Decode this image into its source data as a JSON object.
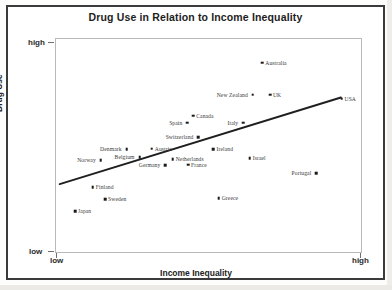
{
  "chart_data": {
    "type": "scatter",
    "title": "Drug Use in Relation to Income Inequality",
    "xlabel": "Income Inequality",
    "ylabel": "Drug Use",
    "xticks": [
      "low",
      "high"
    ],
    "yticks": [
      "low",
      "high"
    ],
    "xlim": [
      "low",
      "high"
    ],
    "ylim": [
      "low",
      "high"
    ],
    "grid": false,
    "legend": null,
    "trendline": {
      "present": true,
      "x0": 0.012,
      "y0": 0.325,
      "x1": 0.928,
      "y1": 0.728
    },
    "points": [
      {
        "label": "Australia",
        "x": 0.672,
        "y": 0.89,
        "label_side": "right"
      },
      {
        "label": "New Zealand",
        "x": 0.641,
        "y": 0.74,
        "label_side": "left"
      },
      {
        "label": "UK",
        "x": 0.697,
        "y": 0.74,
        "label_side": "right"
      },
      {
        "label": "USA",
        "x": 0.93,
        "y": 0.722,
        "label_side": "right"
      },
      {
        "label": "Canada",
        "x": 0.447,
        "y": 0.643,
        "label_side": "right"
      },
      {
        "label": "Spain",
        "x": 0.428,
        "y": 0.61,
        "label_side": "left"
      },
      {
        "label": "Italy",
        "x": 0.61,
        "y": 0.61,
        "label_side": "left"
      },
      {
        "label": "Switzerland",
        "x": 0.464,
        "y": 0.543,
        "label_side": "left"
      },
      {
        "label": "Denmark",
        "x": 0.23,
        "y": 0.488,
        "label_side": "left"
      },
      {
        "label": "Austria",
        "x": 0.312,
        "y": 0.49,
        "label_side": "right"
      },
      {
        "label": "Ireland",
        "x": 0.513,
        "y": 0.488,
        "label_side": "right"
      },
      {
        "label": "Belgium",
        "x": 0.272,
        "y": 0.45,
        "label_side": "left"
      },
      {
        "label": "Netherlands",
        "x": 0.38,
        "y": 0.442,
        "label_side": "right"
      },
      {
        "label": "Israel",
        "x": 0.631,
        "y": 0.445,
        "label_side": "right"
      },
      {
        "label": "Norway",
        "x": 0.146,
        "y": 0.435,
        "label_side": "left"
      },
      {
        "label": "Germany",
        "x": 0.356,
        "y": 0.412,
        "label_side": "left"
      },
      {
        "label": "France",
        "x": 0.43,
        "y": 0.415,
        "label_side": "right"
      },
      {
        "label": "Portugal",
        "x": 0.848,
        "y": 0.375,
        "label_side": "left"
      },
      {
        "label": "Finland",
        "x": 0.12,
        "y": 0.31,
        "label_side": "right"
      },
      {
        "label": "Sweden",
        "x": 0.16,
        "y": 0.255,
        "label_side": "right"
      },
      {
        "label": "Greece",
        "x": 0.53,
        "y": 0.26,
        "label_side": "right"
      },
      {
        "label": "Japan",
        "x": 0.062,
        "y": 0.2,
        "label_side": "right"
      }
    ]
  },
  "chart": {
    "title": "Drug Use in Relation to Income Inequality",
    "x_axis_title": "Income Inequality",
    "y_axis_title": "Drug Use",
    "x_tick_low": "low",
    "x_tick_high": "high",
    "y_tick_low": "low",
    "y_tick_high": "high"
  },
  "colors": {
    "border": "#3b3b3b",
    "plot_frame": "#b9b9b9",
    "point": "#1a1a1a",
    "label_text": "#3a3a3a",
    "trend_line": "#1f1f1f",
    "background": "#ffffff"
  }
}
